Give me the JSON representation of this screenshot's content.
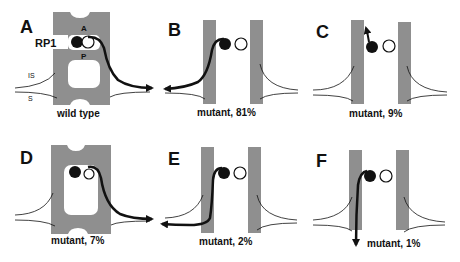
{
  "figure": {
    "panels": [
      {
        "letter": "A",
        "caption": "wild type",
        "rp1_label": "RP1",
        "site_top": "A",
        "site_bottom": "P",
        "is_label": "IS",
        "s_label": "S"
      },
      {
        "letter": "B",
        "caption": "mutant, 81%"
      },
      {
        "letter": "C",
        "caption": "mutant, 9%"
      },
      {
        "letter": "D",
        "caption": "mutant, 7%"
      },
      {
        "letter": "E",
        "caption": "mutant, 2%"
      },
      {
        "letter": "F",
        "caption": "mutant, 1%"
      }
    ],
    "colors": {
      "wall": "#8f8f8f",
      "ink": "#111111",
      "background": "#ffffff"
    }
  }
}
